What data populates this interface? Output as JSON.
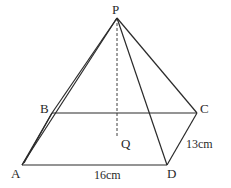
{
  "diagram": {
    "type": "square-based pyramid",
    "vertices": {
      "P": {
        "label": "P",
        "x": 117,
        "y": 18
      },
      "A": {
        "label": "A",
        "x": 22,
        "y": 165
      },
      "B": {
        "label": "B",
        "x": 52,
        "y": 113
      },
      "C": {
        "label": "C",
        "x": 197,
        "y": 113
      },
      "D": {
        "label": "D",
        "x": 167,
        "y": 165
      },
      "Q": {
        "label": "Q",
        "x": 117,
        "y": 138
      }
    },
    "dimensions": {
      "AD": "16cm",
      "DC": "13cm"
    },
    "colors": {
      "line": "#2a2a2a",
      "background": "#ffffff"
    }
  }
}
